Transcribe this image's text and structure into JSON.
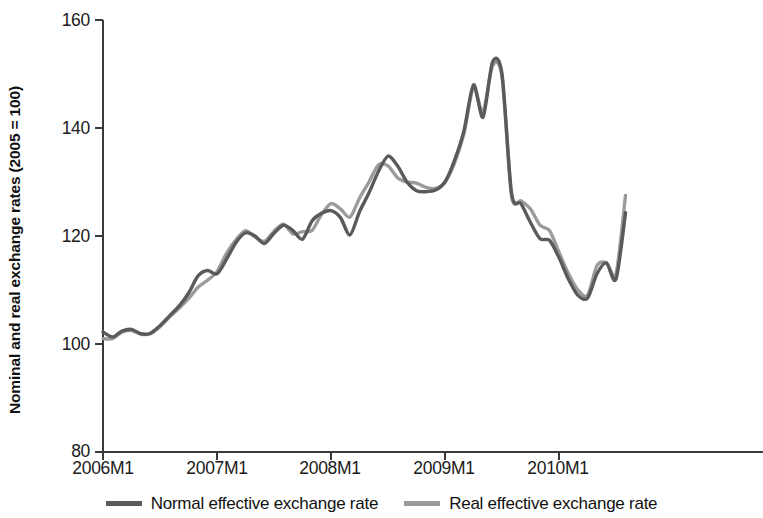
{
  "chart_data": {
    "type": "line",
    "title": "",
    "xlabel": "",
    "ylabel": "Nominal and real exchange rates (2005 = 100)",
    "ylim": [
      80,
      160
    ],
    "yticks": [
      80,
      100,
      120,
      140,
      160
    ],
    "xticks": [
      "2006M1",
      "2007M1",
      "2008M1",
      "2009M1",
      "2010M1"
    ],
    "xtick_indices": [
      0,
      12,
      24,
      36,
      48
    ],
    "grid": false,
    "legend_position": "bottom",
    "x": [
      "2006M1",
      "2006M2",
      "2006M3",
      "2006M4",
      "2006M5",
      "2006M6",
      "2006M7",
      "2006M8",
      "2006M9",
      "2006M10",
      "2006M11",
      "2006M12",
      "2007M1",
      "2007M2",
      "2007M3",
      "2007M4",
      "2007M5",
      "2007M6",
      "2007M7",
      "2007M8",
      "2007M9",
      "2007M10",
      "2007M11",
      "2007M12",
      "2008M1",
      "2008M2",
      "2008M3",
      "2008M4",
      "2008M5",
      "2008M6",
      "2008M7",
      "2008M8",
      "2008M9",
      "2008M10",
      "2008M11",
      "2008M12",
      "2009M1",
      "2009M2",
      "2009M3",
      "2009M4",
      "2009M5",
      "2009M6",
      "2009M7",
      "2009M8",
      "2009M9",
      "2009M10",
      "2009M11",
      "2009M12",
      "2010M1",
      "2010M2",
      "2010M3",
      "2010M4",
      "2010M5",
      "2010M6",
      "2010M7",
      "2010M8"
    ],
    "series": [
      {
        "name": "Normal effective exchange rate",
        "color": "#5a5a5a",
        "values": [
          102.2,
          101.3,
          102.4,
          102.7,
          101.9,
          102.0,
          103.4,
          105.2,
          107.0,
          109.4,
          112.6,
          113.6,
          113.0,
          115.7,
          118.8,
          120.6,
          120.0,
          118.6,
          120.5,
          122.0,
          121.0,
          119.4,
          122.8,
          124.2,
          124.7,
          123.4,
          120.2,
          124.5,
          128.0,
          132.0,
          134.8,
          133.0,
          130.0,
          128.4,
          128.2,
          128.5,
          130.0,
          134.0,
          139.5,
          148.0,
          142.0,
          152.2,
          150.0,
          128.0,
          126.0,
          122.5,
          119.5,
          119.2,
          116.0,
          112.0,
          109.0,
          108.5,
          113.0,
          115.0,
          112.0,
          124.3
        ]
      },
      {
        "name": "Real effective exchange rate",
        "color": "#9b9b9b",
        "values": [
          101.0,
          101.0,
          102.2,
          102.5,
          101.8,
          101.9,
          103.2,
          105.0,
          106.6,
          108.4,
          110.5,
          111.8,
          113.4,
          116.8,
          119.3,
          121.0,
          119.8,
          119.0,
          120.9,
          122.2,
          120.4,
          120.8,
          121.0,
          124.0,
          126.0,
          125.0,
          123.5,
          127.0,
          130.0,
          133.2,
          133.0,
          130.8,
          130.0,
          129.8,
          129.0,
          128.8,
          130.0,
          133.5,
          139.0,
          147.5,
          143.0,
          151.5,
          149.5,
          127.5,
          126.5,
          125.0,
          122.0,
          121.0,
          117.0,
          113.0,
          110.0,
          109.0,
          114.5,
          115.0,
          113.0,
          127.5
        ]
      }
    ]
  },
  "axes": {
    "y_tick_labels": [
      "160",
      "140",
      "120",
      "100",
      "80"
    ],
    "x_tick_labels": [
      "2006M1",
      "2007M1",
      "2008M1",
      "2009M1",
      "2010M1"
    ],
    "y_axis_title": "Nominal and real exchange rates (2005 = 100)"
  },
  "legend": {
    "items": [
      {
        "label": "Normal effective exchange rate",
        "color": "#5a5a5a"
      },
      {
        "label": "Real effective exchange rate",
        "color": "#9b9b9b"
      }
    ]
  }
}
